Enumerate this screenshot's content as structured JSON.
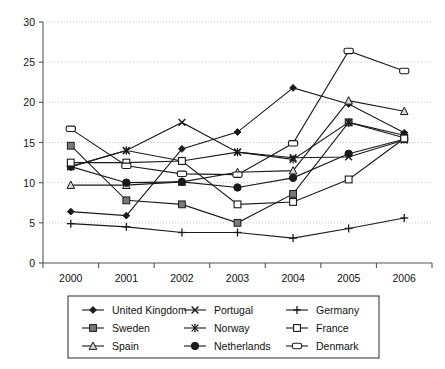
{
  "chart_data": {
    "type": "line",
    "title": "",
    "xlabel": "",
    "ylabel": "",
    "x": [
      2000,
      2001,
      2002,
      2003,
      2004,
      2005,
      2006
    ],
    "xtick_labels": [
      "2000",
      "2001",
      "2002",
      "2003",
      "2004",
      "2005",
      "2006"
    ],
    "ytick_labels": [
      "0",
      "5",
      "10",
      "15",
      "20",
      "25",
      "30"
    ],
    "yticks": [
      0,
      5,
      10,
      15,
      20,
      25,
      30
    ],
    "ylim": [
      0,
      30
    ],
    "grid": true,
    "grid_axis": "y",
    "legend_position": "bottom",
    "legend_columns": 3,
    "series": [
      {
        "name": "United Kingdom",
        "marker": "filled-diamond",
        "values": [
          6.4,
          5.9,
          14.2,
          16.3,
          21.8,
          19.8,
          16.2
        ]
      },
      {
        "name": "Sweden",
        "marker": "filled-square-gray",
        "values": [
          14.6,
          7.8,
          7.3,
          5.0,
          8.6,
          17.5,
          15.6
        ]
      },
      {
        "name": "Spain",
        "marker": "open-triangle",
        "values": [
          9.7,
          9.7,
          10.1,
          11.3,
          11.5,
          20.2,
          18.9
        ]
      },
      {
        "name": "Portugal",
        "marker": "cross-x",
        "values": [
          12.0,
          14.0,
          17.5,
          13.8,
          13.1,
          13.2,
          15.3
        ]
      },
      {
        "name": "Norway",
        "marker": "asterisk",
        "values": [
          12.0,
          14.0,
          12.7,
          13.8,
          12.9,
          17.5,
          15.9
        ]
      },
      {
        "name": "Netherlands",
        "marker": "filled-circle",
        "values": [
          12.0,
          10.0,
          10.1,
          9.4,
          10.6,
          13.6,
          15.4
        ]
      },
      {
        "name": "Germany",
        "marker": "plus",
        "values": [
          4.9,
          4.5,
          3.8,
          3.8,
          3.1,
          4.3,
          5.6
        ]
      },
      {
        "name": "France",
        "marker": "open-square",
        "values": [
          12.5,
          12.5,
          12.7,
          7.3,
          7.6,
          10.4,
          15.5
        ]
      },
      {
        "name": "Denmark",
        "marker": "open-rounded-rect",
        "values": [
          16.7,
          12.1,
          11.1,
          11.0,
          14.9,
          26.4,
          23.9
        ]
      }
    ]
  },
  "legend": {
    "items": [
      {
        "label": "United Kingdom"
      },
      {
        "label": "Portugal"
      },
      {
        "label": "Germany"
      },
      {
        "label": "Sweden"
      },
      {
        "label": "Norway"
      },
      {
        "label": "France"
      },
      {
        "label": "Spain"
      },
      {
        "label": "Netherlands"
      },
      {
        "label": "Denmark"
      }
    ]
  },
  "colors": {
    "line": "#1a1a1a",
    "grid": "#b9b9b9",
    "axis": "#555555",
    "marker_gray": "#7a7a7a",
    "background": "#ffffff"
  }
}
